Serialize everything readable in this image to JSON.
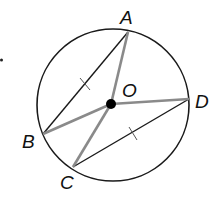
{
  "diagram": {
    "type": "circle-geometry",
    "circle": {
      "center_label": "O",
      "cx": 113,
      "cy": 105,
      "r": 77
    },
    "points": [
      {
        "label": "A",
        "x": 128,
        "y": 32
      },
      {
        "label": "B",
        "x": 43,
        "y": 134
      },
      {
        "label": "C",
        "x": 73,
        "y": 167
      },
      {
        "label": "D",
        "x": 189,
        "y": 99
      },
      {
        "label": "O",
        "x": 111,
        "y": 104
      }
    ],
    "chords": [
      {
        "from": "A",
        "to": "B",
        "congruent_mark": true
      },
      {
        "from": "C",
        "to": "D",
        "congruent_mark": true
      }
    ],
    "radii": [
      {
        "from": "O",
        "to": "A"
      },
      {
        "from": "O",
        "to": "B"
      },
      {
        "from": "O",
        "to": "C"
      },
      {
        "from": "O",
        "to": "D"
      }
    ],
    "colors": {
      "chord": "#1a1a1a",
      "radius": "#8a8a8a",
      "circle": "#1a1a1a"
    }
  },
  "labels": {
    "A": "A",
    "B": "B",
    "C": "C",
    "D": "D",
    "O": "O"
  }
}
